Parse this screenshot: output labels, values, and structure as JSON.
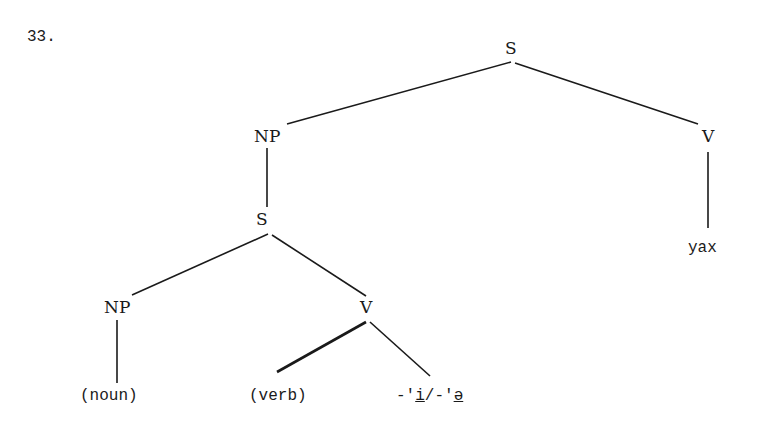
{
  "example_number": "33.",
  "tree": {
    "root": {
      "label": "S"
    },
    "np_top": {
      "label": "NP"
    },
    "v_top": {
      "label": "V"
    },
    "v_top_leaf": {
      "label": "yax"
    },
    "s_embedded": {
      "label": "S"
    },
    "np_low": {
      "label": "NP"
    },
    "v_low": {
      "label": "V"
    },
    "leaf_noun": {
      "label": "(noun)"
    },
    "leaf_verb": {
      "label": "(verb)"
    },
    "leaf_suffix": {
      "prefix1": "-'",
      "vowel1": "i",
      "sep": "/-'",
      "vowel2": "ə"
    }
  },
  "edges": [
    [
      "S",
      "NP"
    ],
    [
      "S",
      "V"
    ],
    [
      "V",
      "yax"
    ],
    [
      "NP",
      "S"
    ],
    [
      "S",
      "NP"
    ],
    [
      "S",
      "V"
    ],
    [
      "NP",
      "(noun)"
    ],
    [
      "V",
      "(verb)"
    ],
    [
      "V",
      "-'i/-'ə"
    ]
  ]
}
